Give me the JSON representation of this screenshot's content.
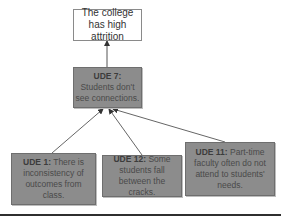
{
  "diagram": {
    "type": "current-reality-tree",
    "top_effect": {
      "text": "The college has high attrition"
    },
    "nodes": [
      {
        "id": "ude7",
        "tag": "UDE 7:",
        "text": "Students don't see connections."
      },
      {
        "id": "ude1",
        "tag": "UDE 1:",
        "text": "There is inconsistency of outcomes from class."
      },
      {
        "id": "ude12",
        "tag": "UDE 12:",
        "text": "Some students fall between the cracks."
      },
      {
        "id": "ude11",
        "tag": "UDE 11:",
        "text": "Part-time faculty often do not attend to students' needs."
      }
    ],
    "edges": [
      {
        "from": "ude7",
        "to": "top_effect"
      },
      {
        "from": "ude1",
        "to": "ude7"
      },
      {
        "from": "ude12",
        "to": "ude7"
      },
      {
        "from": "ude11",
        "to": "ude7"
      }
    ],
    "colors": {
      "ude_fill": "#8c8c8c",
      "ude_text": "#4a4a4a",
      "effect_fill": "#ffffff",
      "arrow": "#555555",
      "rule": "#2f2f2f"
    }
  }
}
